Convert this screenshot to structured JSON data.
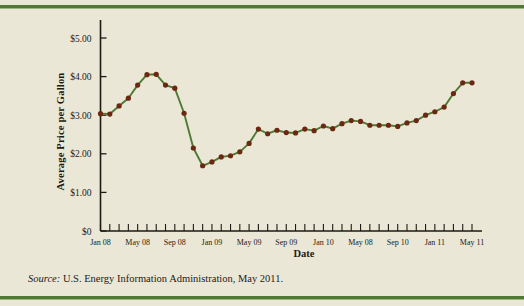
{
  "figure": {
    "background_color": "#ebe7d7",
    "rule_color": "#4e7a35",
    "line_color": "#4e7a35",
    "marker_color": "#6b2712",
    "axis_color": "#1d1a14"
  },
  "axis_titles": {
    "y": "Average Price per Gallon",
    "x": "Date"
  },
  "source": {
    "key": "Source:",
    "text": " U.S. Energy Information Administration, May 2011."
  },
  "chart_data": {
    "type": "line",
    "title": "",
    "xlabel": "Date",
    "ylabel": "Average Price per Gallon",
    "ylim": [
      0,
      5
    ],
    "ytick_values": [
      0,
      1,
      2,
      3,
      4,
      5
    ],
    "ytick_labels": [
      "$0",
      "$1.00",
      "$2.00",
      "$3.00",
      "$4.00",
      "$5.00"
    ],
    "grid": false,
    "legend": "none",
    "xtick_labels": [
      "Jan 08",
      "May 08",
      "Sep 08",
      "Jan 09",
      "May 09",
      "Sep 09",
      "Jan 10",
      "May 08",
      "Sep 10",
      "Jan 11",
      "May 11"
    ],
    "xtick_indices": [
      0,
      4,
      8,
      12,
      16,
      20,
      24,
      28,
      32,
      36,
      40
    ],
    "x": [
      "Jan 08",
      "Feb 08",
      "Mar 08",
      "Apr 08",
      "May 08",
      "Jun 08",
      "Jul 08",
      "Aug 08",
      "Sep 08",
      "Oct 08",
      "Nov 08",
      "Dec 08",
      "Jan 09",
      "Feb 09",
      "Mar 09",
      "Apr 09",
      "May 09",
      "Jun 09",
      "Jul 09",
      "Aug 09",
      "Sep 09",
      "Oct 09",
      "Nov 09",
      "Dec 09",
      "Jan 10",
      "Feb 10",
      "Mar 10",
      "Apr 10",
      "May 10",
      "Jun 10",
      "Jul 10",
      "Aug 10",
      "Sep 10",
      "Oct 10",
      "Nov 10",
      "Dec 10",
      "Jan 11",
      "Feb 11",
      "Mar 11",
      "Apr 11",
      "May 11"
    ],
    "values": [
      3.04,
      3.03,
      3.24,
      3.44,
      3.78,
      4.05,
      4.06,
      3.78,
      3.7,
      3.05,
      2.15,
      1.69,
      1.79,
      1.92,
      1.95,
      2.05,
      2.27,
      2.64,
      2.52,
      2.61,
      2.55,
      2.54,
      2.64,
      2.6,
      2.72,
      2.65,
      2.78,
      2.86,
      2.84,
      2.74,
      2.74,
      2.74,
      2.71,
      2.8,
      2.86,
      3.0,
      3.09,
      3.21,
      3.56,
      3.84,
      3.84
    ],
    "ymax_point": 4.06,
    "ymin_point": 1.69
  }
}
